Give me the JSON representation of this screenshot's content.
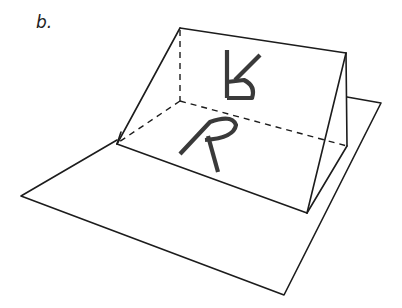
{
  "figure": {
    "panel_label": "b.",
    "letters": {
      "on_plane": "R",
      "reflection": "R (mirrored/inverted)"
    },
    "colors": {
      "line": "#1c1c1c",
      "letter": "#3a3a3a",
      "background": "#ffffff"
    }
  }
}
